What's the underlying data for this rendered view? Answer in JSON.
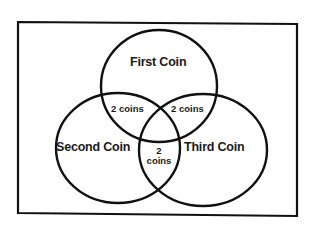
{
  "diagram": {
    "type": "venn",
    "sets": [
      {
        "id": "first",
        "label": "First Coin"
      },
      {
        "id": "second",
        "label": "Second Coin"
      },
      {
        "id": "third",
        "label": "Third Coin"
      }
    ],
    "intersections": [
      {
        "sets": [
          "first",
          "second"
        ],
        "label": "2 coins"
      },
      {
        "sets": [
          "first",
          "third"
        ],
        "label": "2 coins"
      },
      {
        "sets": [
          "second",
          "third"
        ],
        "label_line1": "2",
        "label_line2": "coins"
      }
    ]
  },
  "labels": {
    "first": "First Coin",
    "second": "Second Coin",
    "third": "Third Coin",
    "first_second": "2 coins",
    "first_third": "2 coins",
    "second_third_num": "2",
    "second_third_word": "coins"
  },
  "colors": {
    "stroke": "#111111",
    "background": "#ffffff",
    "text": "#1a1a1a"
  }
}
